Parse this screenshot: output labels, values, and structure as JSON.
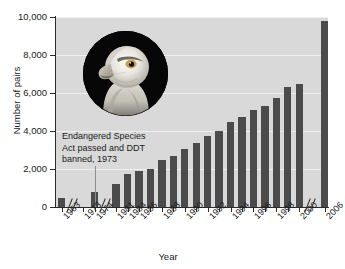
{
  "chart_data": {
    "type": "bar",
    "title": "",
    "xlabel": "Year",
    "ylabel": "Number of pairs",
    "ylim": [
      0,
      10000
    ],
    "ytick_labels": [
      "10,000",
      "8,000",
      "6,000",
      "4,000",
      "2,000",
      "0"
    ],
    "ytick_values": [
      10000,
      8000,
      6000,
      4000,
      2000,
      0
    ],
    "grid": true,
    "legend": null,
    "axis_breaks": [
      "after 1963",
      "after 1974",
      "after 2000"
    ],
    "categories": [
      "1963",
      "1973",
      "1974",
      "1981",
      "1984",
      "1986",
      "1987",
      "1988",
      "1989",
      "1990",
      "1991",
      "1992",
      "1993",
      "1994",
      "1995",
      "1996",
      "1997",
      "1998",
      "1999",
      "2000",
      "2006"
    ],
    "tick_labels": [
      "1963",
      "1973",
      "1974",
      "1981",
      "1984",
      "1986",
      "1988",
      "1990",
      "1992",
      "1994",
      "1996",
      "1998",
      "2000",
      "2006"
    ],
    "values": [
      487,
      0,
      791,
      1188,
      1757,
      1875,
      2015,
      2475,
      2680,
      3035,
      3391,
      3749,
      4015,
      4450,
      4712,
      5094,
      5295,
      5748,
      6300,
      6471,
      9789
    ],
    "annotation": {
      "lines": [
        "Endangered Species",
        "Act passed and DDT",
        "banned, 1973"
      ],
      "at_year": "1973"
    },
    "image_caption": "bald-eagle-head-photo",
    "colors": {
      "bar": "#4b4b4b",
      "plot_background": "#d9d9d9",
      "gridline": "#efefef",
      "axis": "#2b2b2b",
      "page_background": "#ffffff",
      "annotation_line": "#8e8e8e",
      "photo_background": "#070707"
    }
  }
}
